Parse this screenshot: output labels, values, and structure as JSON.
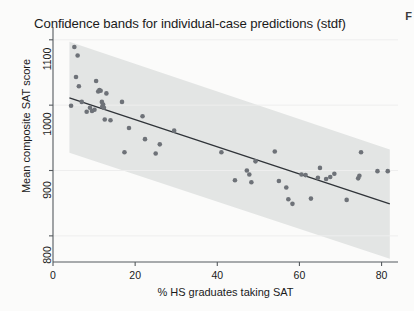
{
  "figure": {
    "title": "Confidence bands for individual-case predictions (stdf)",
    "corner_mark": "F",
    "background_color": "#fbfbfa",
    "page_background_color": "#f2f2f0"
  },
  "chart_data": {
    "type": "scatter",
    "title": "Confidence bands for individual-case predictions (stdf)",
    "xlabel": "% HS graduates taking SAT",
    "ylabel": "Mean composite SAT score",
    "xlim": [
      0,
      84
    ],
    "ylim": [
      760,
      1115
    ],
    "xticks": [
      0,
      20,
      40,
      60,
      80
    ],
    "xtick_labels": [
      "0",
      "20",
      "40",
      "60",
      "80"
    ],
    "yticks": [
      800,
      900,
      1000,
      1100
    ],
    "ytick_labels": [
      "800",
      "900",
      "1000",
      "1100"
    ],
    "grid": false,
    "legend": "none",
    "colors": {
      "marker": "#6e7278",
      "fit_line": "#2f3338",
      "band_fill": "#e3e5e4",
      "axis": "#555a5e",
      "text": "#1a1a1a"
    },
    "series": [
      {
        "name": "states",
        "type": "scatter",
        "marker_size": 4.6,
        "points": [
          {
            "x": 4.4,
            "y": 999
          },
          {
            "x": 5.2,
            "y": 1089
          },
          {
            "x": 5.6,
            "y": 1043
          },
          {
            "x": 6.0,
            "y": 1076
          },
          {
            "x": 6.3,
            "y": 1029
          },
          {
            "x": 7.0,
            "y": 1005
          },
          {
            "x": 8.2,
            "y": 990
          },
          {
            "x": 9.0,
            "y": 996
          },
          {
            "x": 9.5,
            "y": 991
          },
          {
            "x": 10.1,
            "y": 993
          },
          {
            "x": 10.5,
            "y": 1037
          },
          {
            "x": 11.0,
            "y": 1021
          },
          {
            "x": 11.3,
            "y": 1023
          },
          {
            "x": 11.6,
            "y": 1022
          },
          {
            "x": 11.9,
            "y": 1005
          },
          {
            "x": 12.0,
            "y": 998
          },
          {
            "x": 12.2,
            "y": 1001
          },
          {
            "x": 12.4,
            "y": 996
          },
          {
            "x": 12.6,
            "y": 978
          },
          {
            "x": 13.0,
            "y": 1018
          },
          {
            "x": 14.0,
            "y": 977
          },
          {
            "x": 16.8,
            "y": 1005
          },
          {
            "x": 17.4,
            "y": 928
          },
          {
            "x": 18.5,
            "y": 965
          },
          {
            "x": 21.8,
            "y": 983
          },
          {
            "x": 22.4,
            "y": 948
          },
          {
            "x": 25.0,
            "y": 926
          },
          {
            "x": 26.0,
            "y": 940
          },
          {
            "x": 29.5,
            "y": 961
          },
          {
            "x": 41.0,
            "y": 928
          },
          {
            "x": 44.3,
            "y": 885
          },
          {
            "x": 47.2,
            "y": 900
          },
          {
            "x": 47.8,
            "y": 894
          },
          {
            "x": 48.3,
            "y": 882
          },
          {
            "x": 49.3,
            "y": 914
          },
          {
            "x": 54.0,
            "y": 929
          },
          {
            "x": 55.0,
            "y": 884
          },
          {
            "x": 56.8,
            "y": 874
          },
          {
            "x": 57.3,
            "y": 856
          },
          {
            "x": 58.3,
            "y": 849
          },
          {
            "x": 60.5,
            "y": 894
          },
          {
            "x": 61.5,
            "y": 893
          },
          {
            "x": 62.8,
            "y": 857
          },
          {
            "x": 64.5,
            "y": 889
          },
          {
            "x": 65.0,
            "y": 904
          },
          {
            "x": 66.5,
            "y": 887
          },
          {
            "x": 67.5,
            "y": 890
          },
          {
            "x": 68.5,
            "y": 895
          },
          {
            "x": 71.5,
            "y": 855
          },
          {
            "x": 74.3,
            "y": 888
          },
          {
            "x": 74.6,
            "y": 892
          },
          {
            "x": 75.0,
            "y": 928
          },
          {
            "x": 79.0,
            "y": 899
          },
          {
            "x": 81.5,
            "y": 899
          }
        ]
      }
    ],
    "fit_line": {
      "name": "linear prediction",
      "x_start": 4.0,
      "y_start": 1011,
      "x_end": 82.0,
      "y_end": 849
    },
    "confidence_band": {
      "name": "individual-case prediction band (stdf)",
      "x_start": 4.0,
      "x_end": 82.0,
      "upper_start": 1097,
      "lower_start": 927,
      "upper_end": 932,
      "lower_end": 765
    }
  }
}
